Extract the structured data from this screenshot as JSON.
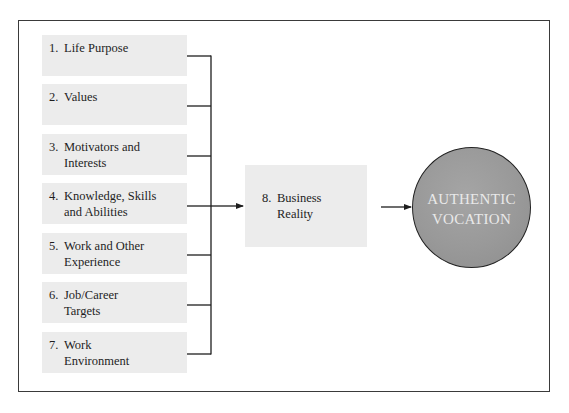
{
  "diagram": {
    "inputs": [
      {
        "num": "1.",
        "text": "Life Purpose"
      },
      {
        "num": "2.",
        "text": "Values"
      },
      {
        "num": "3.",
        "text": "Motivators and\nInterests"
      },
      {
        "num": "4.",
        "text": "Knowledge, Skills\nand Abilities"
      },
      {
        "num": "5.",
        "text": "Work and Other\nExperience"
      },
      {
        "num": "6.",
        "text": "Job/Career\nTargets"
      },
      {
        "num": "7.",
        "text": "Work\nEnvironment"
      }
    ],
    "filter": {
      "num": "8.",
      "text": "Business\nReality"
    },
    "outcome": {
      "text": "AUTHENTIC\nVOCATION"
    }
  }
}
